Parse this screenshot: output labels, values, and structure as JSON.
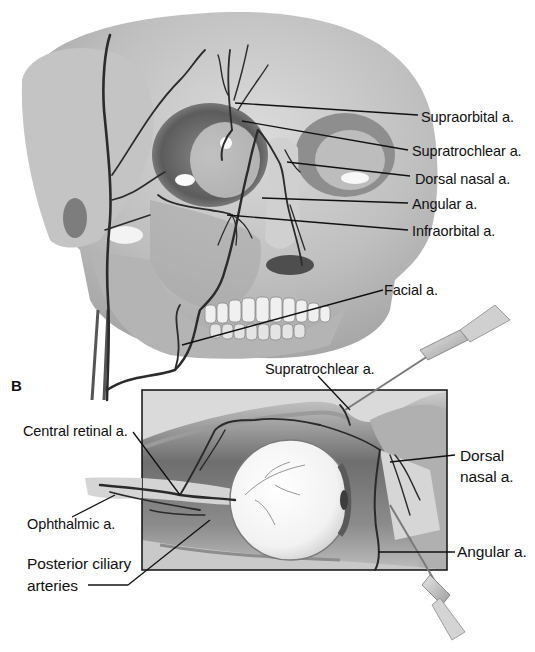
{
  "figure": {
    "panel_a": {
      "subject": "Frontal skull with facial arteries",
      "labels": [
        {
          "id": "supraorbital",
          "text": "Supraorbital a.",
          "x": 421,
          "y": 110
        },
        {
          "id": "supratrochlear",
          "text": "Supratrochlear a.",
          "x": 413,
          "y": 144
        },
        {
          "id": "dorsal-nasal",
          "text": "Dorsal nasal a.",
          "x": 416,
          "y": 173
        },
        {
          "id": "angular",
          "text": "Angular a.",
          "x": 413,
          "y": 198
        },
        {
          "id": "infraorbital",
          "text": "Infraorbital a.",
          "x": 413,
          "y": 225
        },
        {
          "id": "facial",
          "text": "Facial a.",
          "x": 384,
          "y": 285
        }
      ]
    },
    "panel_b": {
      "letter": "B",
      "subject": "Sagittal orbit with eye and instruments",
      "labels": [
        {
          "id": "supratrochlear-b",
          "text": "Supratrochlear a.",
          "x": 265,
          "y": 362
        },
        {
          "id": "central-retinal",
          "text": "Central retinal a.",
          "x": 23,
          "y": 425
        },
        {
          "id": "dorsal-nasal-b-1",
          "text": "Dorsal",
          "x": 460,
          "y": 450
        },
        {
          "id": "dorsal-nasal-b-2",
          "text": "nasal a.",
          "x": 460,
          "y": 470
        },
        {
          "id": "ophthalmic",
          "text": "Ophthalmic a.",
          "x": 27,
          "y": 518
        },
        {
          "id": "angular-b",
          "text": "Angular a.",
          "x": 457,
          "y": 545
        },
        {
          "id": "posterior-ciliary-1",
          "text": "Posterior ciliary",
          "x": 27,
          "y": 557
        },
        {
          "id": "posterior-ciliary-2",
          "text": "arteries",
          "x": 27,
          "y": 579
        }
      ]
    }
  }
}
